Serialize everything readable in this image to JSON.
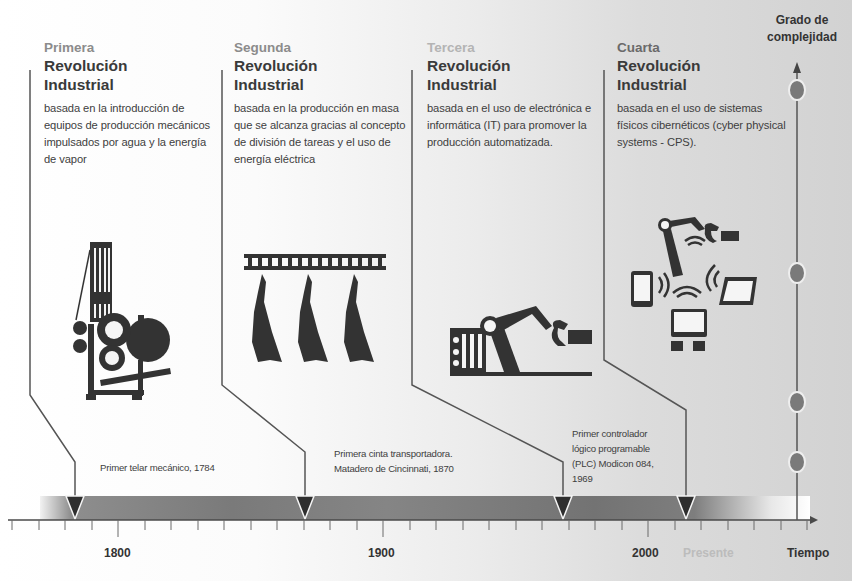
{
  "revolutions": [
    {
      "ordinal": "Primera",
      "title_line1": "Revolución",
      "title_line2": "Industrial",
      "description": "basada en la introducción de equipos de producción mecánicos impulsados por agua y la energía de vapor",
      "icon": "mechanical-loom-icon"
    },
    {
      "ordinal": "Segunda",
      "title_line1": "Revolución",
      "title_line2": "Industrial",
      "description": "basada en la producción en masa que se alcanza gracias al concepto de  división de tareas y el uso de energía eléctrica",
      "icon": "assembly-line-icon"
    },
    {
      "ordinal": "Tercera",
      "title_line1": "Revolución",
      "title_line2": "Industrial",
      "description": "basada en el uso de electrónica e informática (IT) para promover la producción automatizada.",
      "icon": "robot-arm-icon"
    },
    {
      "ordinal": "Cuarta",
      "title_line1": "Revolución",
      "title_line2": "Industrial",
      "description": "basada en el uso de sistemas físicos cibernéticos (cyber physical systems - CPS).",
      "icon": "cyber-physical-network-icon"
    }
  ],
  "events": [
    {
      "text": "Primer telar mecánico, 1784"
    },
    {
      "text_line1": "Primera cinta transportadora.",
      "text_line2": "Matadero de Cincinnati, 1870"
    },
    {
      "text_line1": "Primer controlador",
      "text_line2": "lógico programable",
      "text_line3": "(PLC) Modicon 084,",
      "text_line4": "1969"
    }
  ],
  "timeline": {
    "years": [
      "1800",
      "1900",
      "2000"
    ],
    "present_label": "Presente",
    "x_axis_label": "Tiempo",
    "y_axis_label_line1": "Grado de",
    "y_axis_label_line2": "complejidad"
  },
  "colors": {
    "bar_dark": "#6e6e6e",
    "bar_mid": "#8a8a8a",
    "marker": "#2e2e2e",
    "line": "#4a4a4a",
    "circle": "#7d7d7d"
  }
}
